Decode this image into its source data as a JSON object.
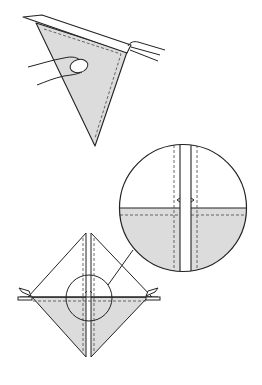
{
  "diagram": {
    "kind": "origami-instruction",
    "colors": {
      "stroke": "#222222",
      "paper_fill": "#dcdcdc",
      "background": "#ffffff",
      "dashed": "#444444"
    },
    "caption_cut_off": "",
    "steps": [
      {
        "id": "step-top",
        "description": "Hand holding a folded triangular flap; paper strip pinched at the right corner",
        "elements": [
          "shaded-triangle",
          "dashed-seam-lines",
          "top-band",
          "hand",
          "pinching-fingers"
        ]
      },
      {
        "id": "step-bottom",
        "description": "Square folded into a diamond with a center gap, with a magnified detail circle showing the notch",
        "elements": [
          "diamond-left-half",
          "diamond-right-half",
          "horizontal-crease",
          "corner-tabs",
          "small-focus-circle",
          "leader-line",
          "magnified-circle"
        ]
      }
    ]
  }
}
